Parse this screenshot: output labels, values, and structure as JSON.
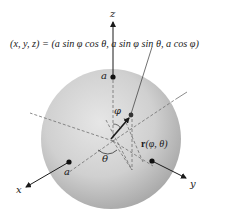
{
  "diagram": {
    "type": "sphere-parametrization",
    "equation": "(x, y, z) = (a sin φ cos θ, a sin φ sin θ, a cos φ)",
    "axes": {
      "z": "z",
      "x": "x",
      "y": "y"
    },
    "points": {
      "top": "a",
      "x_intercept": "a"
    },
    "angles": {
      "phi": "φ",
      "theta": "θ"
    },
    "vector_label": {
      "bold": "r",
      "args": "(φ, θ)"
    },
    "colors": {
      "sphere_light": "#e4e4e4",
      "sphere_dark": "#a9a9a9",
      "ink": "#1a1a1a",
      "dash": "#6e6e6e"
    }
  }
}
